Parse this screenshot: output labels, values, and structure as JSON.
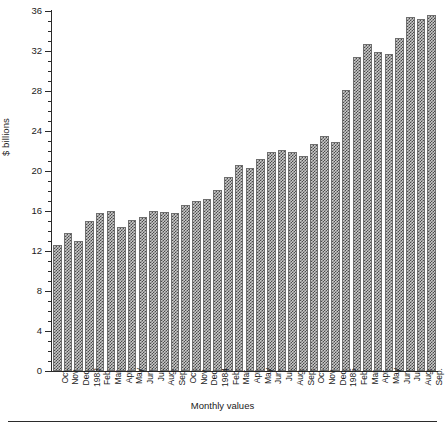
{
  "chart_data": {
    "type": "bar",
    "title": "",
    "subtitle": "",
    "xlabel": "Monthly values",
    "ylabel": "$ billions",
    "ylim": [
      0,
      36
    ],
    "y_major_ticks": [
      0,
      4,
      8,
      12,
      16,
      20,
      24,
      28,
      32,
      36
    ],
    "y_minor_tick_step": 1,
    "grid": false,
    "legend": "none",
    "categories": [
      "Oct.",
      "Nov.",
      "Dec.",
      "1983",
      "Feb.",
      "Mar.",
      "Apr.",
      "May",
      "Jun.",
      "Jul.",
      "Aug.",
      "Sep.",
      "Oct.",
      "Nov.",
      "Dec.",
      "1984",
      "Feb.",
      "Mar.",
      "Apr.",
      "May",
      "Jun.",
      "Jul.",
      "Aug.",
      "Sep.",
      "Oct.",
      "Nov.",
      "Dec.",
      "1985",
      "Feb.",
      "Mar.",
      "Apr.",
      "May",
      "Jun.",
      "Jul.",
      "Aug.",
      "Sep."
    ],
    "values": [
      12.6,
      13.8,
      13.0,
      15.0,
      15.8,
      16.0,
      14.4,
      15.1,
      15.4,
      16.0,
      15.9,
      15.8,
      16.6,
      17.0,
      17.2,
      18.1,
      19.4,
      20.6,
      20.3,
      21.2,
      21.9,
      22.1,
      21.9,
      21.5,
      22.7,
      23.5,
      22.9,
      28.1,
      31.4,
      32.7,
      31.9,
      31.7,
      33.3,
      35.4,
      35.2,
      35.6
    ],
    "bar_fill_pattern": "checkerboard",
    "bar_fill_color": "#c9c9c9",
    "bar_pattern_color": "#4a4a4a",
    "bar_border_color": "#6f6f6f",
    "axis_color": "#2b2b2b"
  }
}
